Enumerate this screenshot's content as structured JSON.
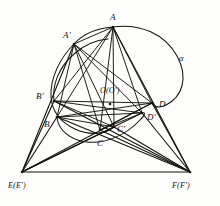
{
  "figure": {
    "stroke_color": "#15130f",
    "background_color": "#fdfdfc",
    "width": 220,
    "height": 206
  },
  "labels": {
    "A": {
      "text": "A",
      "x": 110,
      "y": 13
    },
    "Aprime": {
      "text": "A'",
      "x": 63,
      "y": 31
    },
    "Bprime": {
      "text": "B'",
      "x": 36,
      "y": 92
    },
    "B": {
      "text": "B",
      "x": 44,
      "y": 120
    },
    "O": {
      "text": "O(O')",
      "x": 100,
      "y": 87
    },
    "D": {
      "text": "D",
      "x": 159,
      "y": 100
    },
    "Dprime": {
      "text": "D'",
      "x": 147,
      "y": 113
    },
    "Cprime": {
      "text": "C'",
      "x": 117,
      "y": 125
    },
    "C": {
      "text": "C",
      "x": 97,
      "y": 139
    },
    "alpha": {
      "text": "α",
      "x": 179,
      "y": 54
    },
    "E": {
      "text": "E(E')",
      "x": 8,
      "y": 182
    },
    "F": {
      "text": "F(F')",
      "x": 172,
      "y": 182
    }
  },
  "points": {
    "A": {
      "x": 113,
      "y": 27
    },
    "Aprime": {
      "x": 74,
      "y": 44
    },
    "Bprime": {
      "x": 54,
      "y": 101
    },
    "B": {
      "x": 57,
      "y": 117
    },
    "O": {
      "x": 110,
      "y": 104
    },
    "D": {
      "x": 152,
      "y": 103
    },
    "Dprime": {
      "x": 142,
      "y": 113
    },
    "Cprime": {
      "x": 114,
      "y": 127
    },
    "C": {
      "x": 100,
      "y": 130
    },
    "E": {
      "x": 22,
      "y": 172
    },
    "F": {
      "x": 190,
      "y": 172
    }
  },
  "curves": {
    "alpha_label": "α",
    "conic_outer": "large loop through A and D on the right",
    "conic_inner": "smaller oval through A', B', B, C"
  }
}
